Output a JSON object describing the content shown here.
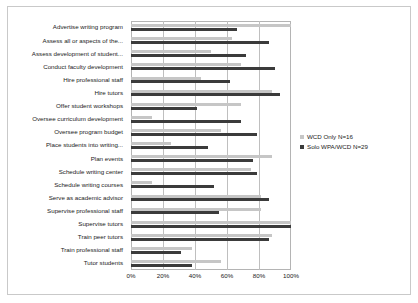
{
  "chart_data": {
    "type": "bar",
    "orientation": "horizontal",
    "title": "",
    "subtitle": "",
    "xlabel": "",
    "ylabel": "",
    "xlim": [
      0,
      100
    ],
    "xticks": [
      "0%",
      "20%",
      "40%",
      "60%",
      "80%",
      "100%"
    ],
    "xtick_values": [
      0,
      20,
      40,
      60,
      80,
      100
    ],
    "grid": true,
    "legend_position": "right",
    "categories": [
      "Advertise writing program",
      "Assess all or aspects of the...",
      "Assess development of student...",
      "Conduct faculty development",
      "Hire professional staff",
      "Hire tutors",
      "Offer student workshops",
      "Oversee curriculum development",
      "Oversee program budget",
      "Place students into writing...",
      "Plan events",
      "Schedule writing center",
      "Schedule writing courses",
      "Serve as academic advisor",
      "Supervise professional staff",
      "Supervise tutors",
      "Train peer tutors",
      "Train professional staff",
      "Tutor students"
    ],
    "series": [
      {
        "name": "WCD Only N=16",
        "color": "#c6c6c6",
        "values": [
          100,
          63,
          50,
          69,
          44,
          88,
          69,
          13,
          56,
          25,
          88,
          75,
          13,
          81,
          81,
          100,
          88,
          38,
          56
        ]
      },
      {
        "name": "Solo WPA/WCD N=29",
        "color": "#3b3b3b",
        "values": [
          66,
          86,
          72,
          90,
          62,
          93,
          41,
          69,
          79,
          48,
          76,
          79,
          52,
          86,
          55,
          100,
          86,
          31,
          38
        ]
      }
    ]
  },
  "legend": {
    "entries": [
      {
        "label": "WCD Only N=16",
        "color": "#c6c6c6"
      },
      {
        "label": "Solo WPA/WCD N=29",
        "color": "#3b3b3b"
      }
    ]
  }
}
